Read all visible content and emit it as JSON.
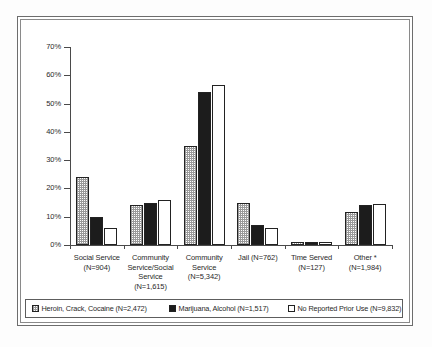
{
  "chart_data": {
    "type": "bar",
    "title": "",
    "subtitle": "",
    "xlabel": "",
    "ylabel": "",
    "ylim": [
      0,
      70
    ],
    "grid": false,
    "legend_position": "bottom",
    "y_ticks": [
      "0%",
      "10%",
      "20%",
      "30%",
      "40%",
      "50%",
      "60%",
      "70%"
    ],
    "y_tick_values": [
      0,
      10,
      20,
      30,
      40,
      50,
      60,
      70
    ],
    "categories": [
      "Social Service\n(N=904)",
      "Community\nService/Social\nService\n(N=1,615)",
      "Community\nService\n(N=5,342)",
      "Jail (N=762)",
      "Time Served\n(N=127)",
      "Other *\n(N=1,984)"
    ],
    "category_lines": [
      [
        "Social Service",
        "(N=904)"
      ],
      [
        "Community",
        "Service/Social",
        "Service",
        "(N=1,615)"
      ],
      [
        "Community",
        "Service",
        "(N=5,342)"
      ],
      [
        "Jail (N=762)"
      ],
      [
        "Time Served",
        "(N=127)"
      ],
      [
        "Other *",
        "(N=1,984)"
      ]
    ],
    "series": [
      {
        "name": "Heroin, Crack, Cocaine (N=2,472)",
        "swatch": "checker-light",
        "values": [
          24,
          14,
          35,
          15,
          1,
          11.5
        ]
      },
      {
        "name": "Marijuana, Alcohol (N=1,517)",
        "swatch": "solid-black",
        "values": [
          10,
          15,
          54,
          7,
          1,
          14
        ]
      },
      {
        "name": "No Reported Prior Use (N=9,832)",
        "swatch": "white-open",
        "values": [
          6,
          16,
          56.5,
          6,
          1,
          14.5
        ]
      }
    ]
  },
  "legend": {
    "items": [
      {
        "label": "Heroin, Crack, Cocaine (N=2,472)",
        "swatch": "checker-light"
      },
      {
        "label": "Marijuana, Alcohol (N=1,517)",
        "swatch": "solid-black"
      },
      {
        "label": "No Reported Prior Use (N=9,832)",
        "swatch": "white-open"
      }
    ]
  },
  "colors": {
    "axis": "#4a4a4a",
    "bar_outline": "#222222",
    "series_black": "#1c1c1c",
    "series_white": "#ffffff",
    "frame": "#6d6d6d"
  }
}
